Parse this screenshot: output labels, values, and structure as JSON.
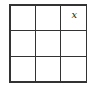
{
  "grid": {
    "rows": 3,
    "cols": 3,
    "cells": [
      [
        "",
        "",
        "x"
      ],
      [
        "",
        "",
        ""
      ],
      [
        "",
        "",
        ""
      ]
    ]
  }
}
